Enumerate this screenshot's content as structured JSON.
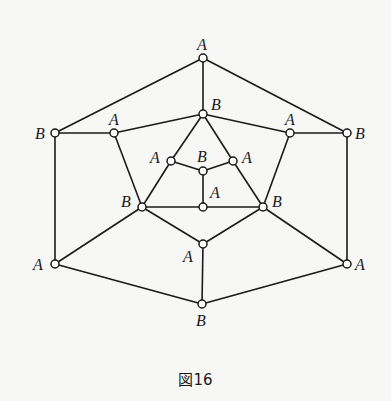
{
  "figure": {
    "caption": "図16"
  },
  "graph": {
    "nodes": [
      {
        "id": "n0",
        "label": "A",
        "x": 203,
        "y": 58,
        "lx": 197,
        "ly": 50
      },
      {
        "id": "n1",
        "label": "B",
        "x": 203,
        "y": 114,
        "lx": 211,
        "ly": 110
      },
      {
        "id": "n2",
        "label": "B",
        "x": 55,
        "y": 133,
        "lx": 35,
        "ly": 139
      },
      {
        "id": "n3",
        "label": "A",
        "x": 114,
        "y": 133,
        "lx": 109,
        "ly": 125
      },
      {
        "id": "n4",
        "label": "A",
        "x": 290,
        "y": 133,
        "lx": 285,
        "ly": 125
      },
      {
        "id": "n5",
        "label": "B",
        "x": 347,
        "y": 133,
        "lx": 355,
        "ly": 139
      },
      {
        "id": "n6",
        "label": "A",
        "x": 171,
        "y": 161,
        "lx": 150,
        "ly": 163
      },
      {
        "id": "n7",
        "label": "B",
        "x": 203,
        "y": 171,
        "lx": 197,
        "ly": 162
      },
      {
        "id": "n8",
        "label": "A",
        "x": 233,
        "y": 161,
        "lx": 242,
        "ly": 163
      },
      {
        "id": "n9",
        "label": "B",
        "x": 142,
        "y": 207,
        "lx": 121,
        "ly": 207
      },
      {
        "id": "n10",
        "label": "A",
        "x": 203,
        "y": 207,
        "lx": 210,
        "ly": 198
      },
      {
        "id": "n11",
        "label": "B",
        "x": 263,
        "y": 207,
        "lx": 272,
        "ly": 207
      },
      {
        "id": "n12",
        "label": "A",
        "x": 203,
        "y": 244,
        "lx": 183,
        "ly": 262
      },
      {
        "id": "n13",
        "label": "A",
        "x": 55,
        "y": 264,
        "lx": 33,
        "ly": 270
      },
      {
        "id": "n14",
        "label": "A",
        "x": 347,
        "y": 264,
        "lx": 355,
        "ly": 270
      },
      {
        "id": "n15",
        "label": "B",
        "x": 202,
        "y": 304,
        "lx": 196,
        "ly": 326
      }
    ],
    "edges": [
      [
        "n0",
        "n2"
      ],
      [
        "n0",
        "n5"
      ],
      [
        "n0",
        "n1"
      ],
      [
        "n2",
        "n3"
      ],
      [
        "n4",
        "n5"
      ],
      [
        "n3",
        "n1"
      ],
      [
        "n1",
        "n4"
      ],
      [
        "n1",
        "n6"
      ],
      [
        "n1",
        "n8"
      ],
      [
        "n6",
        "n7"
      ],
      [
        "n7",
        "n8"
      ],
      [
        "n7",
        "n10"
      ],
      [
        "n6",
        "n9"
      ],
      [
        "n8",
        "n11"
      ],
      [
        "n3",
        "n9"
      ],
      [
        "n4",
        "n11"
      ],
      [
        "n9",
        "n10"
      ],
      [
        "n10",
        "n11"
      ],
      [
        "n9",
        "n12"
      ],
      [
        "n11",
        "n12"
      ],
      [
        "n12",
        "n15"
      ],
      [
        "n2",
        "n13"
      ],
      [
        "n5",
        "n14"
      ],
      [
        "n9",
        "n13"
      ],
      [
        "n11",
        "n14"
      ],
      [
        "n13",
        "n15"
      ],
      [
        "n14",
        "n15"
      ]
    ]
  }
}
